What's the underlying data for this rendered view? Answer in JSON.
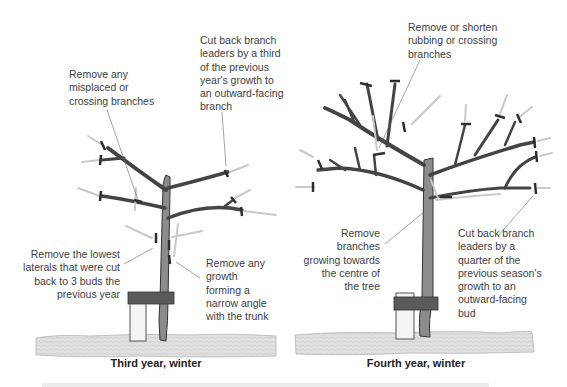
{
  "panels": [
    {
      "caption": "Third year, winter",
      "annotations": {
        "misplaced": "Remove any\nmisplaced or\ncrossing branches",
        "cut_third": "Cut back branch\nleaders by a third\nof the previous\nyear's growth to\nan outward-facing\nbranch",
        "lowest_laterals": "Remove the lowest\nlaterals that were cut\nback to 3 buds the\nprevious year",
        "narrow_angle": "Remove any\ngrowth\nforming a\nnarrow angle\nwith the trunk"
      }
    },
    {
      "caption": "Fourth year, winter",
      "annotations": {
        "rubbing": "Remove or shorten\nrubbing or crossing\nbranches",
        "centre": "Remove\nbranches\ngrowing towards\nthe centre of\nthe tree",
        "cut_quarter": "Cut back branch\nleaders by a\nquarter of the\nprevious season's\ngrowth to an\noutward-facing\nbud"
      }
    }
  ],
  "colors": {
    "ground": "#d9d9d9",
    "trunk": "#6b6b6b",
    "tie": "#4a4a4a",
    "cut_mark": "#333333",
    "pruned_growth": "#c8c8c8"
  }
}
